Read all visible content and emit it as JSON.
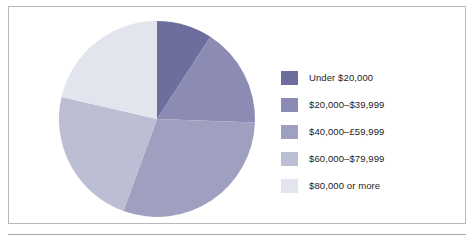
{
  "figure": {
    "frame_border_color": "#b9b9bd",
    "background_color": "#ffffff",
    "rule_color": "#a8a8ad"
  },
  "legend": {
    "position": "right",
    "items": [
      {
        "label": "Under $20,000",
        "color": "#6d6d9e"
      },
      {
        "label": "$20,000–$39,999",
        "color": "#8b8bb4"
      },
      {
        "label": "$40,000–£59,999",
        "color": "#9f9fc0"
      },
      {
        "label": "$60,000–$79,999",
        "color": "#bcbed3"
      },
      {
        "label": "$80,000 or more",
        "color": "#e2e4ee"
      }
    ]
  },
  "chart_data": {
    "type": "pie",
    "title": "",
    "subtitle": "",
    "xlabel": "",
    "ylabel": "",
    "grid": false,
    "legend_position": "right",
    "start_angle_deg": 0,
    "direction": "clockwise",
    "center": {
      "cx": 100,
      "cy": 100
    },
    "radius": 98,
    "categories": [
      "Under $20,000",
      "$20,000–$39,999",
      "$40,000–£59,999",
      "$60,000–$79,999",
      "$80,000 or more"
    ],
    "values": [
      9,
      16,
      30,
      23,
      21
    ],
    "units": "percent",
    "colors": [
      "#6d6d9e",
      "#8b8bb4",
      "#9f9fc0",
      "#bcbed3",
      "#e2e4ee"
    ],
    "slice_angles_deg": [
      {
        "name": "Under $20,000",
        "start": 0,
        "end": 33
      },
      {
        "name": "$20,000–$39,999",
        "start": 33,
        "end": 92
      },
      {
        "name": "$40,000–£59,999",
        "start": 92,
        "end": 200
      },
      {
        "name": "$60,000–$79,999",
        "start": 200,
        "end": 283
      },
      {
        "name": "$80,000 or more",
        "start": 283,
        "end": 360
      }
    ],
    "data_labels_shown": false
  }
}
